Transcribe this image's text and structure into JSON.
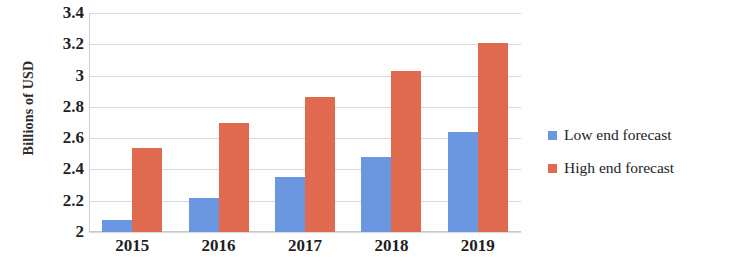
{
  "chart_data": {
    "type": "bar",
    "title": "",
    "xlabel": "",
    "ylabel": "Billions of USD",
    "categories": [
      "2015",
      "2016",
      "2017",
      "2018",
      "2019"
    ],
    "series": [
      {
        "name": "Low end forecast",
        "color": "#6b97e0",
        "values": [
          2.08,
          2.22,
          2.35,
          2.48,
          2.64
        ]
      },
      {
        "name": "High end forecast",
        "color": "#e06a50",
        "values": [
          2.54,
          2.7,
          2.86,
          3.03,
          3.21
        ]
      }
    ],
    "ylim": [
      2,
      3.4
    ],
    "ytick_labels": [
      "3.4",
      "3.2",
      "3",
      "2.8",
      "2.6",
      "2.4",
      "2.2",
      "2"
    ],
    "ytick_values": [
      3.4,
      3.2,
      3.0,
      2.8,
      2.6,
      2.4,
      2.2,
      2.0
    ],
    "grid": true,
    "legend_position": "right"
  },
  "legend": {
    "entries": [
      {
        "label": "Low end forecast",
        "color": "#6b97e0"
      },
      {
        "label": "High end forecast",
        "color": "#e06a50"
      }
    ]
  }
}
